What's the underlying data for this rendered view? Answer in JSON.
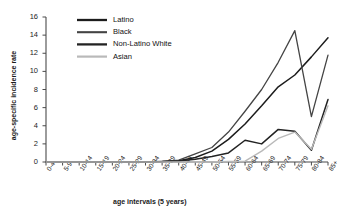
{
  "chart_data": {
    "type": "line",
    "title": "",
    "xlabel": "age intervals (5 years)",
    "ylabel": "age-specific incidence rate",
    "categories": [
      "0-4",
      "5-9",
      "10-14",
      "15-19",
      "20-24",
      "25-29",
      "30-34",
      "35-39",
      "40-44",
      "45-49",
      "50-54",
      "55-59",
      "60-64",
      "65-69",
      "70-74",
      "75-79",
      "80-84",
      "85+"
    ],
    "ylim": [
      0,
      16
    ],
    "yticks": [
      0,
      2,
      4,
      6,
      8,
      10,
      12,
      14,
      16
    ],
    "grid": false,
    "legend_position": "top-center",
    "series": [
      {
        "name": "Latino",
        "color": "#1c1c1c",
        "width": 1.5,
        "values": [
          0,
          0,
          0,
          0,
          0,
          0,
          0,
          0.05,
          0.15,
          0.5,
          1.2,
          2.5,
          4.2,
          6.2,
          8.3,
          9.6,
          11.6,
          13.7
        ]
      },
      {
        "name": "Black",
        "color": "#444444",
        "width": 1.3,
        "values": [
          0,
          0,
          0,
          0,
          0,
          0,
          0,
          0.05,
          0.2,
          0.9,
          1.6,
          3.3,
          5.6,
          8.0,
          11.0,
          14.5,
          5.0,
          11.8
        ]
      },
      {
        "name": "Non-Latino White",
        "color": "#232323",
        "width": 1.5,
        "values": [
          0,
          0,
          0,
          0,
          0,
          0,
          0,
          0.05,
          0.1,
          0.3,
          0.6,
          1.0,
          2.4,
          2.0,
          3.6,
          3.4,
          1.3,
          6.9
        ]
      },
      {
        "name": "Asian",
        "color": "#b9b9b9",
        "width": 1.4,
        "values": [
          0,
          0,
          0,
          0,
          0,
          0,
          0,
          0,
          0,
          0,
          0,
          0.05,
          0.1,
          1.2,
          2.6,
          3.3,
          1.4,
          6.2
        ]
      }
    ]
  },
  "legend": {
    "items": [
      {
        "label": "Latino"
      },
      {
        "label": "Black"
      },
      {
        "label": "Non-Latino White"
      },
      {
        "label": "Asian"
      }
    ]
  }
}
